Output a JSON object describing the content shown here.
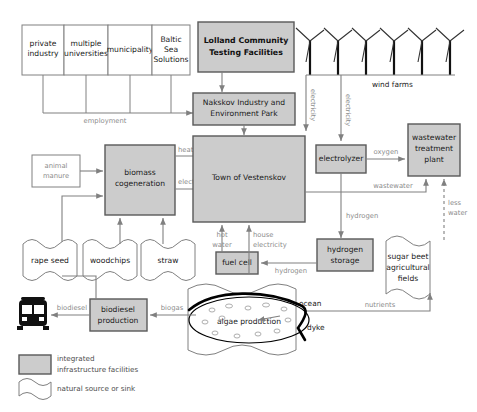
{
  "diagram": {
    "colors": {
      "integrated_fill": "#cccccc",
      "integrated_stroke": "#595959",
      "natural_stroke": "#808080",
      "flow_label": "#8c8c8c"
    }
  },
  "stakeholders": [
    {
      "id": "private-industry",
      "label_line1": "private",
      "label_line2": "industry"
    },
    {
      "id": "multiple-universities",
      "label_line1": "multiple",
      "label_line2": "universities"
    },
    {
      "id": "municipality",
      "label_line1": "municipality",
      "label_line2": ""
    },
    {
      "id": "baltic-sea-solutions",
      "label_line1": "Baltic",
      "label_line2": "Sea",
      "label_line3": "Solutions"
    }
  ],
  "nodes": {
    "lolland": {
      "label_line1": "Lolland Community",
      "label_line2": "Testing Facilities",
      "type": "integrated"
    },
    "nakskov": {
      "label_line1": "Nakskov Industry and",
      "label_line2": "Environment Park",
      "type": "integrated"
    },
    "biomass": {
      "label_line1": "biomass",
      "label_line2": "cogeneration",
      "type": "integrated"
    },
    "town": {
      "label_line1": "Town of Vestenskov",
      "label_line2": "",
      "type": "integrated"
    },
    "electrolyzer": {
      "label_line1": "electrolyzer",
      "label_line2": "",
      "type": "integrated"
    },
    "wastewater_plant": {
      "label_line1": "wastewater",
      "label_line2": "treatment",
      "label_line3": "plant",
      "type": "integrated"
    },
    "hydrogen_storage": {
      "label_line1": "hydrogen",
      "label_line2": "storage",
      "type": "integrated"
    },
    "fuel_cell": {
      "label_line1": "fuel cell",
      "label_line2": "",
      "type": "integrated"
    },
    "biodiesel": {
      "label_line1": "biodiesel",
      "label_line2": "production",
      "type": "integrated"
    },
    "animal_manure": {
      "label_line1": "animal",
      "label_line2": "manure",
      "type": "open"
    },
    "rape_seed": {
      "label_line1": "rape seed",
      "type": "natural"
    },
    "woodchips": {
      "label_line1": "woodchips",
      "type": "natural"
    },
    "straw": {
      "label_line1": "straw",
      "type": "natural"
    },
    "sugar_beet": {
      "label_line1": "sugar beet",
      "label_line2": "agricultural",
      "label_line3": "fields",
      "type": "natural"
    },
    "ocean": {
      "label_line1": "ocean",
      "type": "natural"
    },
    "algae": {
      "label_line1": "algae production",
      "type": "natural"
    },
    "wind_farms": {
      "label_line1": "wind farms",
      "type": "natural",
      "turbine_count": 6
    },
    "bus": {
      "label_line1": "bus",
      "type": "icon"
    },
    "dyke": {
      "label_line1": "dyke",
      "type": "feature"
    }
  },
  "flows": [
    {
      "id": "employment",
      "label": "employment"
    },
    {
      "id": "electricity-wind-1",
      "label": "electricity"
    },
    {
      "id": "electricity-wind-2",
      "label": "electricity"
    },
    {
      "id": "heat",
      "label": "heat"
    },
    {
      "id": "electricity-biomass",
      "label": "electricity"
    },
    {
      "id": "oxygen",
      "label": "oxygen"
    },
    {
      "id": "wastewater",
      "label": "wastewater"
    },
    {
      "id": "less-water",
      "label_line1": "less",
      "label_line2": "water"
    },
    {
      "id": "hydrogen-electrolyzer",
      "label": "hydrogen"
    },
    {
      "id": "hydrogen-fuelcell",
      "label": "hydrogen"
    },
    {
      "id": "hot-water",
      "label_line1": "hot",
      "label_line2": "water"
    },
    {
      "id": "house-electricity",
      "label_line1": "house",
      "label_line2": "electricity"
    },
    {
      "id": "biogas",
      "label": "biogas"
    },
    {
      "id": "biodiesel-out",
      "label": "biodiesel"
    },
    {
      "id": "nutrients",
      "label": "nutrients"
    }
  ],
  "legend": [
    {
      "id": "integrated",
      "swatch": "filled-rect",
      "label_line1": "integrated",
      "label_line2": "infrastructure facilities"
    },
    {
      "id": "natural",
      "swatch": "wave-rect",
      "label_line1": "natural source or sink",
      "label_line2": ""
    }
  ]
}
